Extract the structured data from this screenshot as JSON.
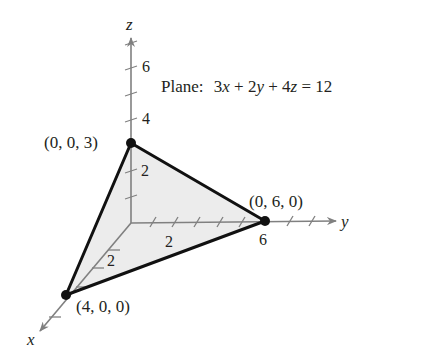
{
  "diagram": {
    "type": "3d-plane-intercepts",
    "plane_label": {
      "prefix": "Plane:",
      "equation_parts": [
        "3",
        "x",
        " + 2",
        "y",
        " + 4",
        "z",
        " = 12"
      ]
    },
    "axes": {
      "x": {
        "label": "x",
        "tick_labels": [
          "2"
        ]
      },
      "y": {
        "label": "y",
        "tick_labels": [
          "2",
          "6"
        ]
      },
      "z": {
        "label": "z",
        "tick_labels": [
          "2",
          "4",
          "6"
        ]
      }
    },
    "points": [
      {
        "label": "(0, 0, 3)",
        "coords": [
          0,
          0,
          3
        ]
      },
      {
        "label": "(0, 6, 0)",
        "coords": [
          0,
          6,
          0
        ]
      },
      {
        "label": "(4, 0, 0)",
        "coords": [
          4,
          0,
          0
        ]
      }
    ],
    "colors": {
      "fill": "#ececec",
      "edge": "#111111",
      "axis": "#808080",
      "text": "#231f20"
    }
  }
}
